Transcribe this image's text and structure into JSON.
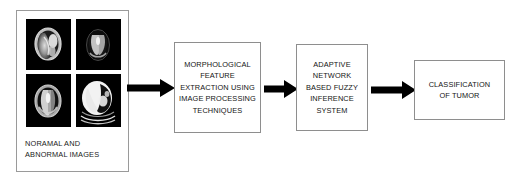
{
  "diagram": {
    "type": "flowchart",
    "title": "",
    "orientation": "left-to-right",
    "input_panel": {
      "name": "input-images-panel",
      "caption_line1": "NORAMAL AND",
      "caption_line2": "ABNORMAL IMAGES",
      "scans": [
        {
          "label": "brain-scan-axial-1",
          "modality": "brain",
          "position": "top-left"
        },
        {
          "label": "brain-scan-axial-2",
          "modality": "brain",
          "position": "top-right"
        },
        {
          "label": "brain-scan-axial-3",
          "modality": "brain",
          "position": "bottom-left"
        },
        {
          "label": "chest-scan-axial-4",
          "modality": "thorax",
          "position": "bottom-right"
        }
      ]
    },
    "nodes": [
      {
        "id": "morphological",
        "name": "morphological-feature-extraction-box",
        "lines": [
          "MORPHOLOGICAL",
          "FEATURE",
          "EXTRACTION USING",
          "IMAGE PROCESSING",
          "TECHNIQUES"
        ]
      },
      {
        "id": "anfis",
        "name": "anfis-box",
        "lines": [
          "ADAPTIVE",
          "NETWORK",
          "BASED FUZZY",
          "INFERENCE",
          "SYSTEM"
        ]
      },
      {
        "id": "classification",
        "name": "classification-of-tumor-box",
        "lines": [
          "CLASSIFICATION",
          "OF TUMOR"
        ]
      }
    ],
    "arrows": [
      {
        "id": "arrow-1",
        "name": "arrow-input-to-morphological",
        "from": "input-images-panel",
        "to": "morphological",
        "direction": "right"
      },
      {
        "id": "arrow-2",
        "name": "arrow-morphological-to-anfis",
        "from": "morphological",
        "to": "anfis",
        "direction": "right"
      },
      {
        "id": "arrow-3",
        "name": "arrow-anfis-to-classification",
        "from": "anfis",
        "to": "classification",
        "direction": "right"
      }
    ],
    "colors": {
      "background": "#ffffff",
      "box_border": "#8e8e8e",
      "panel_border": "#9a9a9a",
      "text": "#141414",
      "arrow": "#000000",
      "scan_background": "#000000"
    }
  }
}
